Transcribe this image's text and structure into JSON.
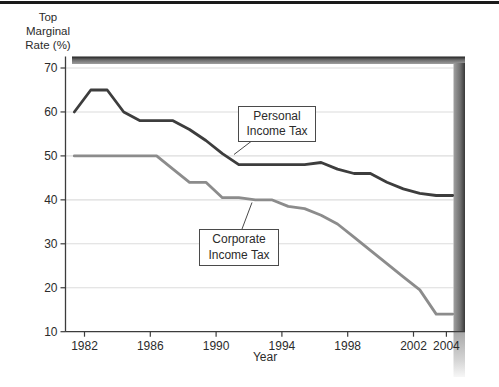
{
  "figure": {
    "y_axis_title_lines": [
      "Top",
      "Marginal",
      "Rate (%)"
    ],
    "x_axis_label": "Year"
  },
  "chart_data": {
    "type": "line",
    "title": "",
    "xlabel": "Year",
    "ylabel": "Top Marginal Rate (%)",
    "x_ticks": [
      1982,
      1986,
      1990,
      1994,
      1998,
      2002,
      2004
    ],
    "y_ticks": [
      10,
      20,
      30,
      40,
      50,
      60,
      70
    ],
    "xlim": [
      1980.85,
      2004.55
    ],
    "ylim": [
      10,
      71.5
    ],
    "grid": "horizontal-only",
    "legend": "callout-boxes-with-leader-lines",
    "years": [
      1981,
      1982,
      1983,
      1984,
      1985,
      1986,
      1987,
      1988,
      1989,
      1990,
      1991,
      1992,
      1993,
      1994,
      1995,
      1996,
      1997,
      1998,
      1999,
      2000,
      2001,
      2002,
      2003,
      2004
    ],
    "series": [
      {
        "name": "Personal Income Tax",
        "annotation_lines": [
          "Personal",
          "Income Tax"
        ],
        "color": "#3d3d3d",
        "values": [
          60,
          65,
          65,
          60,
          58,
          58,
          58,
          56,
          53.5,
          50.5,
          48,
          48,
          48,
          48,
          48,
          48.5,
          47,
          46,
          46,
          44,
          42.5,
          41.5,
          41,
          41
        ]
      },
      {
        "name": "Corporate Income Tax",
        "annotation_lines": [
          "Corporate",
          "Income Tax"
        ],
        "color": "#8c8c8c",
        "values": [
          50,
          50,
          50,
          50,
          50,
          50,
          47,
          44,
          44,
          40.5,
          40.5,
          40,
          40,
          38.5,
          38,
          36.5,
          34.5,
          31.5,
          28.5,
          25.5,
          22.5,
          19.5,
          14,
          14
        ]
      }
    ]
  },
  "colors": {
    "background": "#ffffff",
    "top_rule": "#1a1a1a",
    "axis": "#3c3c3c",
    "gridline": "#dcdcdc",
    "frame_shadow_dark": "#1f1f1f",
    "frame_shadow_mid": "#8a8a8a",
    "text": "#2b2b2b"
  }
}
